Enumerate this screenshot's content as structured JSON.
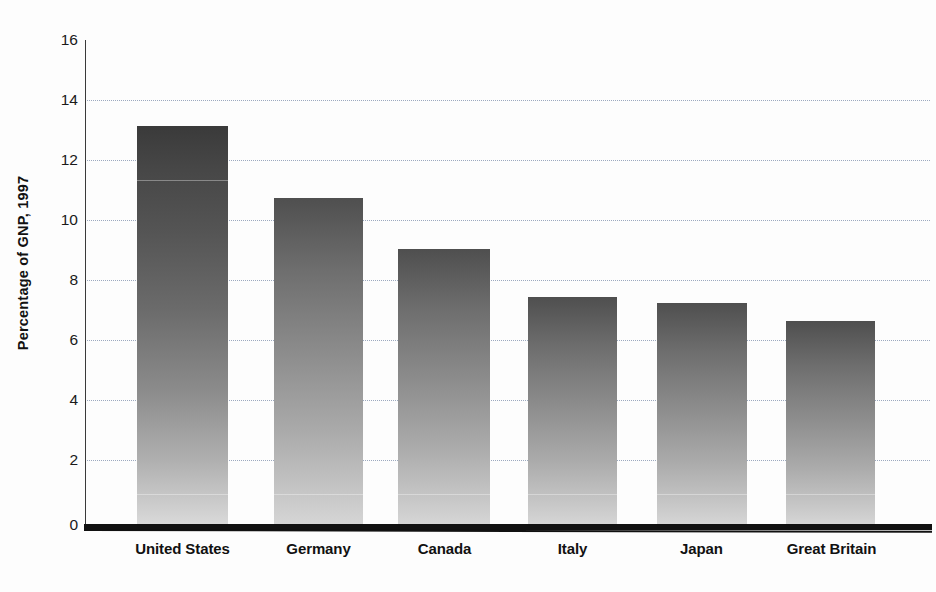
{
  "chart_data": {
    "type": "bar",
    "title": "",
    "subtitle": "",
    "xlabel": "",
    "ylabel": "Percentage of GNP, 1997",
    "categories": [
      "United States",
      "Germany",
      "Canada",
      "Italy",
      "Japan",
      "Great Britain"
    ],
    "values": [
      13.3,
      10.9,
      9.2,
      7.6,
      7.4,
      6.8
    ],
    "series": [
      {
        "name": "Percentage of GNP, 1997",
        "values": [
          13.3,
          10.9,
          9.2,
          7.6,
          7.4,
          6.8
        ]
      }
    ],
    "ylim": [
      0,
      16
    ],
    "xlim_categories": 6,
    "yticks": [
      0,
      2,
      4,
      6,
      8,
      10,
      12,
      14,
      16
    ],
    "ytick_labels": [
      "0",
      "2",
      "4",
      "6",
      "8",
      "10",
      "12",
      "14",
      "16"
    ],
    "grid": true,
    "grid_axis": "y",
    "grid_style": "dotted",
    "legend": false,
    "legend_position": "none",
    "annotations": [],
    "bar_style": "vertical-gradient-dark-top-to-light-bottom"
  },
  "axis": {
    "y_title": "Percentage of GNP, 1997",
    "ticks": [
      {
        "label": "16",
        "value": 16
      },
      {
        "label": "14",
        "value": 14
      },
      {
        "label": "12",
        "value": 12
      },
      {
        "label": "10",
        "value": 10
      },
      {
        "label": "8",
        "value": 8
      },
      {
        "label": "6",
        "value": 6
      },
      {
        "label": "4",
        "value": 4
      },
      {
        "label": "2",
        "value": 2
      },
      {
        "label": "0",
        "value": 0
      }
    ]
  },
  "bars": [
    {
      "label": "United States",
      "value": 13.3,
      "shade": "dark"
    },
    {
      "label": "Germany",
      "value": 10.9,
      "shade": "normal"
    },
    {
      "label": "Canada",
      "value": 9.2,
      "shade": "normal"
    },
    {
      "label": "Italy",
      "value": 7.6,
      "shade": "normal"
    },
    {
      "label": "Japan",
      "value": 7.4,
      "shade": "normal"
    },
    {
      "label": "Great Britain",
      "value": 6.8,
      "shade": "normal"
    }
  ],
  "colors": {
    "background": "#fdfdfd",
    "axis": "#111111",
    "gridline": "#8c9bb5",
    "bar_top": "#3f3f3f",
    "bar_bottom": "#d6d6d6",
    "text": "#1a1a1a"
  }
}
